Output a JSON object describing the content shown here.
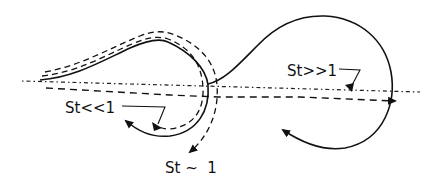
{
  "diagram": {
    "type": "particle-trajectory-schematic",
    "colors": {
      "background": "#ffffff",
      "stroke": "#111111"
    },
    "labels": {
      "st_small": "St<<1",
      "st_large": "St>>1",
      "st_order_one": "St ~  1"
    },
    "legend_semantics": {
      "centerline": "dotted line",
      "solid": "fluid / vortex trajectory",
      "dashed": "particle trajectories"
    }
  }
}
